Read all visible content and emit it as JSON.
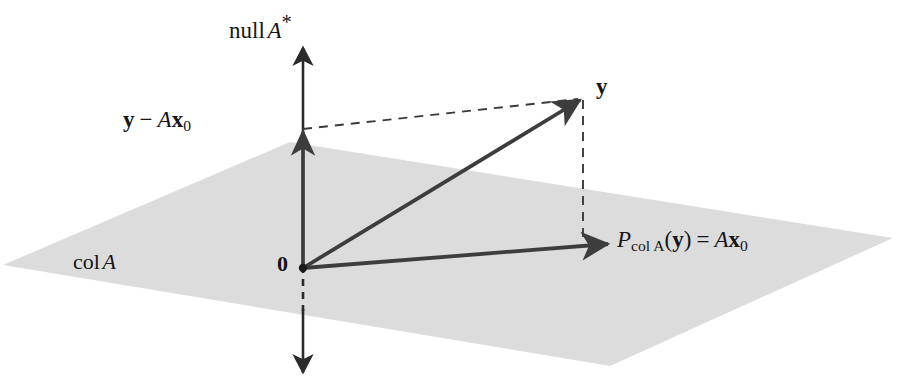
{
  "figure": {
    "background_color": "#ffffff",
    "plane_fill_color": "#dcdcdc",
    "line_color": "#3d3d3d",
    "text_color": "#151515"
  },
  "labels": {
    "null_a_star": {
      "text": "null A*",
      "parts": {
        "name": "null",
        "matrix": "A",
        "star": "*"
      }
    },
    "residual": {
      "text": "y − Ax₀",
      "parts": {
        "y": "y",
        "minus": "−",
        "matrix": "A",
        "x": "x",
        "sub": "0"
      }
    },
    "y_vector": {
      "text": "y"
    },
    "projection": {
      "text": "P_colA(y) = Ax₀",
      "parts": {
        "P": "P",
        "subscript": "col A",
        "open": "(",
        "y": "y",
        "close": ")",
        "equals": "=",
        "matrix": "A",
        "x": "x",
        "sub": "0"
      }
    },
    "col_a": {
      "text": "col A",
      "parts": {
        "name": "col",
        "matrix": "A"
      }
    },
    "origin": {
      "text": "0"
    }
  },
  "geometry": {
    "plane": {
      "shape": "parallelogram",
      "points": [
        [
          3,
          265
        ],
        [
          290,
          142
        ],
        [
          893,
          238
        ],
        [
          610,
          366
        ]
      ]
    },
    "axis_vertical": {
      "name": "null A* axis",
      "x": 303,
      "top_y": 45,
      "bottom_y": 375,
      "arrow_top": true,
      "arrow_bottom": true,
      "dashed_segment": [
        [
          303,
          268
        ],
        [
          303,
          312
        ]
      ]
    },
    "vectors": [
      {
        "name": "y",
        "from": [
          303,
          268
        ],
        "to": [
          583,
          98
        ],
        "style": "solid",
        "arrow": true
      },
      {
        "name": "projection",
        "from": [
          303,
          268
        ],
        "to": [
          611,
          244
        ],
        "style": "solid",
        "arrow": true
      },
      {
        "name": "residual",
        "from": [
          303,
          268
        ],
        "to": [
          303,
          129
        ],
        "style": "solid",
        "arrow": true
      }
    ],
    "dashed_lines": [
      {
        "name": "residual-to-y",
        "from": [
          303,
          129
        ],
        "to": [
          583,
          98
        ]
      },
      {
        "name": "y-to-projection",
        "from": [
          583,
          98
        ],
        "to": [
          583,
          246
        ]
      }
    ],
    "origin_dot": {
      "cx": 303,
      "cy": 268,
      "r": 4.2
    }
  }
}
